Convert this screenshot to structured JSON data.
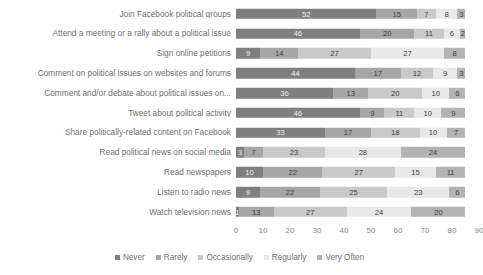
{
  "chart_data": {
    "type": "bar",
    "subtype": "stacked-horizontal-bar",
    "title": "",
    "xlabel": "",
    "ylabel": "",
    "xlim": [
      0,
      90
    ],
    "xticks": [
      0,
      10,
      20,
      30,
      40,
      50,
      60,
      70,
      80,
      90
    ],
    "grid": false,
    "legend_position": "bottom",
    "categories": [
      "Join Facebook political groups",
      "Attend a meeting or a rally about a political issue",
      "Sign online petitions",
      "Comment on political issues on websites and forums",
      "Comment and/or debate about political issues on...",
      "Tweet about political activity",
      "Share politically-related content on Facebook",
      "Read political news on social media",
      "Read newspapers",
      "Listen to radio news",
      "Watch television news"
    ],
    "series": [
      {
        "name": "Never",
        "color": "#7f7f7f",
        "values": [
          52,
          46,
          9,
          44,
          36,
          46,
          33,
          3,
          10,
          9,
          1
        ]
      },
      {
        "name": "Rarely",
        "color": "#a6a6a6",
        "values": [
          15,
          20,
          14,
          17,
          13,
          9,
          17,
          7,
          22,
          22,
          13
        ]
      },
      {
        "name": "Occasionally",
        "color": "#c9c9c9",
        "values": [
          7,
          11,
          27,
          12,
          20,
          11,
          18,
          23,
          27,
          25,
          27
        ]
      },
      {
        "name": "Regularly",
        "color": "#e8e8e8",
        "values": [
          8,
          6,
          27,
          9,
          10,
          10,
          10,
          28,
          15,
          23,
          24
        ]
      },
      {
        "name": "Very Often",
        "color": "#b3b3b3",
        "values": [
          3,
          2,
          8,
          3,
          6,
          9,
          7,
          24,
          11,
          6,
          20
        ]
      }
    ]
  },
  "legend": {
    "items": [
      {
        "label": "Never",
        "color": "#7f7f7f"
      },
      {
        "label": "Rarely",
        "color": "#a6a6a6"
      },
      {
        "label": "Occasionally",
        "color": "#c9c9c9"
      },
      {
        "label": "Regularly",
        "color": "#e8e8e8"
      },
      {
        "label": "Very Often",
        "color": "#b3b3b3"
      }
    ]
  }
}
